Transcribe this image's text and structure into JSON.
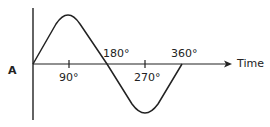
{
  "diagram": {
    "y_label": "A",
    "x_label": "Time",
    "ticks": [
      {
        "label": "90°",
        "degrees": 90
      },
      {
        "label": "180°",
        "degrees": 180
      },
      {
        "label": "270°",
        "degrees": 270
      },
      {
        "label": "360°",
        "degrees": 360
      }
    ],
    "stroke_color": "#222222"
  }
}
